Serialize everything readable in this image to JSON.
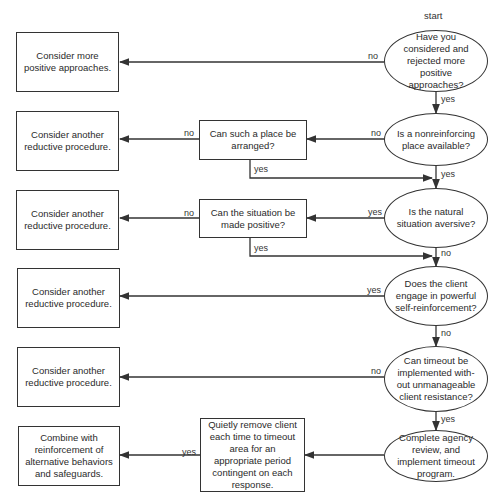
{
  "start_label": "start",
  "decisions": [
    {
      "id": "d1",
      "text": "Have you considered and rejected more positive approaches?"
    },
    {
      "id": "d2",
      "text": "Is a nonreinforcing place available?"
    },
    {
      "id": "d3",
      "text": "Is the natural situation aversive?"
    },
    {
      "id": "d4",
      "text": "Does the client engage in powerful self-reinforcement?"
    },
    {
      "id": "d5",
      "text": "Can timeout be implemented with-out unmanageable client resistance?"
    },
    {
      "id": "d6",
      "text": "Complete agency review, and implement timeout program."
    }
  ],
  "middle_boxes": [
    {
      "id": "m1",
      "text": "Can such a place be arranged?"
    },
    {
      "id": "m2",
      "text": "Can the situation be made positive?"
    },
    {
      "id": "m3",
      "text": "Quietly remove client each time to timeout area for an appropriate period contingent on each response."
    }
  ],
  "outcomes": [
    {
      "id": "o1",
      "text": "Consider more positive approaches."
    },
    {
      "id": "o2",
      "text": "Consider another reductive procedure."
    },
    {
      "id": "o3",
      "text": "Consider another reductive procedure."
    },
    {
      "id": "o4",
      "text": "Consider another reductive procedure."
    },
    {
      "id": "o5",
      "text": "Consider another reductive procedure."
    },
    {
      "id": "o6",
      "text": "Combine with reinforcement of alternative behaviors and safeguards."
    }
  ],
  "edge_labels": {
    "d1_no": "no",
    "d1_yes": "yes",
    "d2_no": "no",
    "d2_yes": "yes",
    "m1_no": "no",
    "m1_yes": "yes",
    "d3_yes": "yes",
    "d3_no": "no",
    "m2_no": "no",
    "m2_yes": "yes",
    "d4_yes": "yes",
    "d4_no": "no",
    "d5_no": "no",
    "d5_yes": "yes",
    "m3_yes": "yes"
  },
  "colors": {
    "line": "#333333",
    "background": "#ffffff",
    "text": "#2a2a2a"
  }
}
